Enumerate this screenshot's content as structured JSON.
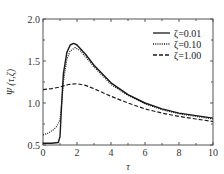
{
  "chart_data": {
    "type": "line",
    "title": "",
    "xlabel": "τ",
    "ylabel": "Ψ (τ,ζ)",
    "xlim": [
      0,
      10
    ],
    "ylim": [
      0.5,
      2.0
    ],
    "xticks": [
      0,
      2,
      4,
      6,
      8,
      10
    ],
    "yticks": [
      0.5,
      1.0,
      1.5,
      2.0
    ],
    "xtick_labels": [
      "0",
      "2",
      "4",
      "6",
      "8",
      "10"
    ],
    "ytick_labels": [
      "0.5",
      "1.0",
      "1.5",
      "2.0"
    ],
    "grid": false,
    "legend_position": "upper right",
    "series": [
      {
        "name": "ζ=0.01",
        "style": "solid",
        "x": [
          0,
          0.5,
          0.9,
          1.0,
          1.1,
          1.2,
          1.4,
          1.6,
          1.8,
          2.0,
          2.5,
          3,
          4,
          5,
          6,
          7,
          8,
          9,
          10
        ],
        "values": [
          0.52,
          0.52,
          0.53,
          0.6,
          1.0,
          1.35,
          1.6,
          1.69,
          1.71,
          1.69,
          1.58,
          1.45,
          1.24,
          1.1,
          1.0,
          0.93,
          0.88,
          0.85,
          0.82
        ]
      },
      {
        "name": "ζ=0.10",
        "style": "dotted",
        "x": [
          0,
          0.3,
          0.6,
          0.8,
          1.0,
          1.1,
          1.2,
          1.4,
          1.6,
          1.9,
          2.2,
          2.5,
          3,
          4,
          5,
          6,
          7,
          8,
          9,
          10
        ],
        "values": [
          0.62,
          0.64,
          0.68,
          0.72,
          0.8,
          1.0,
          1.25,
          1.52,
          1.62,
          1.66,
          1.62,
          1.55,
          1.43,
          1.22,
          1.09,
          0.99,
          0.92,
          0.87,
          0.84,
          0.81
        ]
      },
      {
        "name": "ζ=1.00",
        "style": "dashed",
        "x": [
          0,
          0.5,
          1.0,
          1.5,
          2.0,
          2.5,
          3,
          4,
          5,
          6,
          7,
          8,
          9,
          10
        ],
        "values": [
          1.16,
          1.17,
          1.19,
          1.22,
          1.23,
          1.21,
          1.17,
          1.08,
          1.0,
          0.93,
          0.88,
          0.84,
          0.81,
          0.78
        ]
      }
    ]
  },
  "legend": {
    "items": [
      {
        "label": "ζ=0.01",
        "style": "solid"
      },
      {
        "label": "ζ=0.10",
        "style": "dotted"
      },
      {
        "label": "ζ=1.00",
        "style": "dashed"
      }
    ]
  },
  "axes": {
    "xlabel": "τ",
    "ylabel": "Ψ (τ,ζ)"
  },
  "colors": {
    "line": "#1a1a1a",
    "axis": "#555555"
  }
}
